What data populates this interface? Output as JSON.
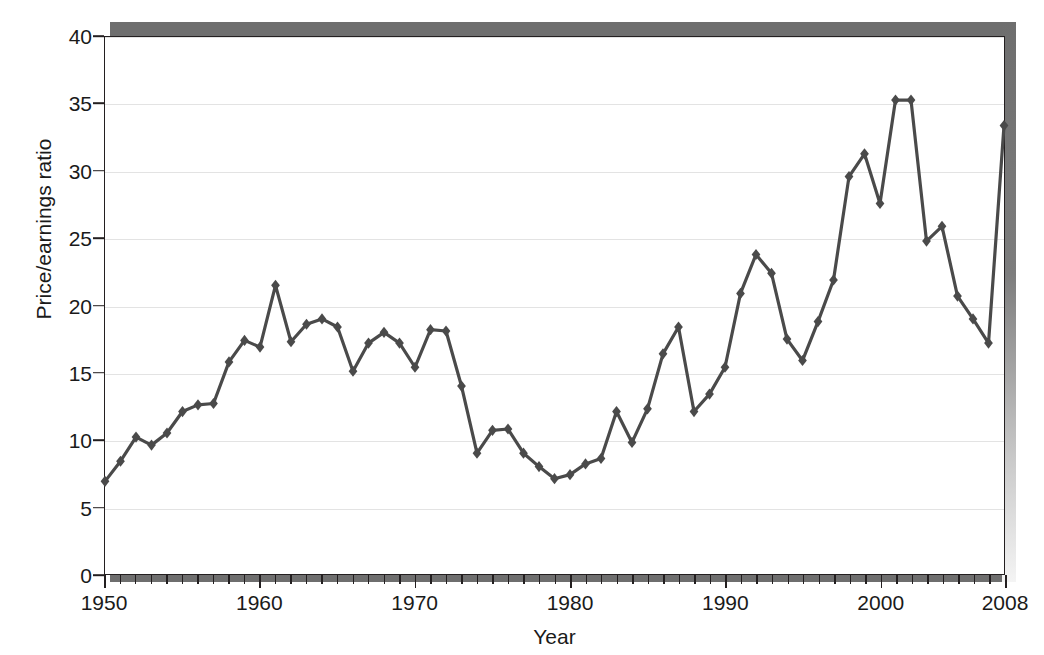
{
  "figure": {
    "caption_ghost": "",
    "background_color": "#ffffff",
    "frame_color": "#231f20",
    "shadow_color": "#6e6e6e"
  },
  "chart_data": {
    "type": "line",
    "title": "",
    "xlabel": "Year",
    "ylabel": "Price/earnings ratio",
    "xlim": [
      1950,
      2008
    ],
    "ylim": [
      0,
      40
    ],
    "grid": true,
    "legend": "none",
    "series_color": "#4a4a4a",
    "marker": "diamond",
    "x_tick_labels": [
      "1950",
      "1960",
      "1970",
      "1980",
      "1990",
      "2000",
      "2008"
    ],
    "x_tick_values": [
      1950,
      1960,
      1970,
      1980,
      1990,
      2000,
      2008
    ],
    "x_minor_tick_step": 1,
    "y_tick_labels": [
      "0",
      "5",
      "10",
      "15",
      "20",
      "25",
      "30",
      "35",
      "40"
    ],
    "y_tick_values": [
      0,
      5,
      10,
      15,
      20,
      25,
      30,
      35,
      40
    ],
    "x": [
      1950,
      1951,
      1952,
      1953,
      1954,
      1955,
      1956,
      1957,
      1958,
      1959,
      1960,
      1961,
      1962,
      1963,
      1964,
      1965,
      1966,
      1967,
      1968,
      1969,
      1970,
      1971,
      1972,
      1973,
      1974,
      1975,
      1976,
      1977,
      1978,
      1979,
      1980,
      1981,
      1982,
      1983,
      1984,
      1985,
      1986,
      1987,
      1988,
      1989,
      1990,
      1991,
      1992,
      1993,
      1994,
      1995,
      1996,
      1997,
      1998,
      1999,
      2000,
      2001,
      2002,
      2003,
      2004,
      2005,
      2006,
      2007,
      2008
    ],
    "values": [
      6.9,
      8.4,
      10.2,
      9.6,
      10.5,
      12.1,
      12.6,
      12.7,
      15.8,
      17.4,
      16.9,
      21.5,
      17.3,
      18.6,
      19.0,
      18.4,
      15.1,
      17.2,
      18.0,
      17.2,
      15.4,
      18.2,
      18.1,
      14.0,
      9.0,
      10.7,
      10.8,
      9.0,
      8.0,
      7.1,
      7.4,
      8.2,
      8.6,
      12.1,
      9.8,
      12.3,
      16.4,
      18.4,
      12.1,
      13.4,
      15.4,
      20.9,
      23.8,
      22.4,
      17.5,
      15.9,
      18.8,
      21.9,
      29.6,
      31.3,
      27.6,
      35.3,
      35.3,
      24.8,
      25.9,
      20.7,
      19.0,
      17.2,
      33.4
    ]
  }
}
